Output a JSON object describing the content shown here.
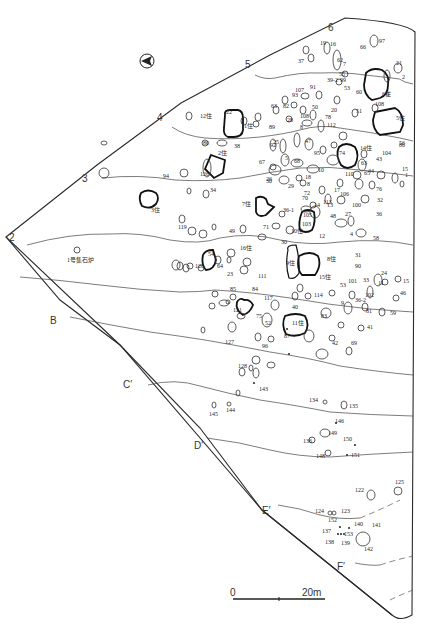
{
  "figure": {
    "type": "archaeological-site-plan",
    "north_arrow": "north-arrow"
  },
  "grid_labels": {
    "numeric": [
      "2",
      "3",
      "4",
      "5",
      "6"
    ],
    "alpha": [
      "B",
      "C′",
      "D′",
      "E′",
      "F′"
    ]
  },
  "scale": {
    "start": "0",
    "end": "20m"
  },
  "features": {
    "stone_cluster_1": "1号集石炉",
    "houses": {
      "h1": "1住",
      "h2": "2住",
      "h3": "3住",
      "h5": "5住",
      "h6": "6住",
      "h7": "7住",
      "h8": "8住",
      "h9": "9住",
      "h10": "10住",
      "h11": "11住",
      "h12": "12住",
      "h14": "14住",
      "h15": "15住",
      "h16": "16住"
    },
    "pits": {
      "p1": "1",
      "p2": "2",
      "p4": "4",
      "p5": "5",
      "p6": "6",
      "p7": "7",
      "p8": "8",
      "p9": "9",
      "p10": "10",
      "p11": "11",
      "p12": "12",
      "p13": "13",
      "p14": "14",
      "p15": "15",
      "p15b": "15",
      "p16": "16",
      "p17": "17",
      "p18": "18",
      "p19": "19",
      "p20": "20",
      "p21": "21",
      "p22": "22",
      "p23": "23",
      "p24": "24",
      "p25": "25",
      "p26": "26",
      "p27": "27",
      "p28": "28",
      "p29": "29",
      "p30": "30",
      "p30b": "30",
      "p31": "31",
      "p32": "32",
      "p33": "33",
      "p34": "34",
      "p36": "36",
      "p36_1": "36-1",
      "p36_2": "36-2",
      "p37": "37",
      "p38": "38",
      "p39_2": "39-2",
      "p40": "40",
      "p41": "41",
      "p42": "42",
      "p43": "43",
      "p44": "44",
      "p46": "46",
      "p47": "47",
      "p48": "48",
      "p49": "49",
      "p50": "50",
      "p51": "51",
      "p52": "52",
      "p53": "53",
      "p53b": "53",
      "p54": "54",
      "p55": "55",
      "p56": "56",
      "p58": "58",
      "p59": "59",
      "p60": "60",
      "p62": "62",
      "p63": "63",
      "p63b": "63",
      "p64": "64",
      "p65": "65",
      "p66": "66",
      "p67": "67",
      "p68": "68",
      "p69": "69",
      "p70": "70",
      "p71": "71",
      "p72": "72",
      "p74": "74",
      "p75": "75",
      "p76": "76",
      "p78": "78",
      "p80": "80",
      "p81": "81",
      "p82": "82",
      "p83": "83",
      "p84": "84",
      "p85": "85",
      "p86": "86",
      "p87": "87",
      "p89": "89",
      "p90": "90",
      "p91": "91",
      "p92": "92",
      "p93": "93",
      "p94": "94",
      "p95": "95",
      "p96": "96",
      "p97": "97",
      "p99": "99",
      "p100": "100",
      "p101": "101",
      "p102": "102",
      "p103": "103",
      "p104": "104",
      "p105": "105",
      "p106": "106",
      "p107": "107",
      "p108": "108",
      "p108b": "108",
      "p110": "110",
      "p111": "111",
      "p112": "112",
      "p113": "113",
      "p114": "114",
      "p117": "117",
      "p119": "119",
      "p120": "120",
      "p121": "121",
      "p122": "122",
      "p123": "123",
      "p124": "124",
      "p125": "125",
      "p126": "126",
      "p127": "127",
      "p128": "128",
      "p134": "134",
      "p135": "135",
      "p136": "136",
      "p137": "137",
      "p138": "138",
      "p139": "139",
      "p140": "140",
      "p141": "141",
      "p142": "142",
      "p143": "143",
      "p144": "144",
      "p145": "145",
      "p146": "146",
      "p148": "148",
      "p149": "149",
      "p150": "150",
      "p151": "151",
      "p152": "152",
      "p153": "153"
    }
  }
}
